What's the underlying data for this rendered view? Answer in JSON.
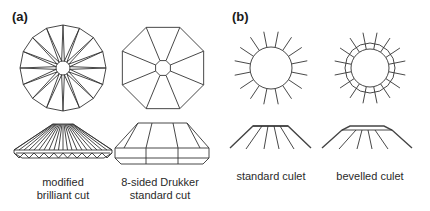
{
  "figure": {
    "panels": [
      {
        "id": "a",
        "label": "(a)",
        "items": [
          {
            "name": "modified-brilliant-cut",
            "caption_line1": "modified",
            "caption_line2": "brilliant cut",
            "top_view": "16-point star in circle",
            "facets": 16
          },
          {
            "name": "drukker-standard-cut",
            "caption_line1": "8-sided Drukker",
            "caption_line2": "standard cut",
            "top_view": "octagon with octagonal culet",
            "facets": 8
          }
        ]
      },
      {
        "id": "b",
        "label": "(b)",
        "items": [
          {
            "name": "standard-culet",
            "caption": "standard culet",
            "rays": 16
          },
          {
            "name": "bevelled-culet",
            "caption": "bevelled culet",
            "rays": 16
          }
        ]
      }
    ],
    "colors": {
      "line": "#333333",
      "text": "#2a2a2a",
      "background": "#ffffff"
    }
  }
}
